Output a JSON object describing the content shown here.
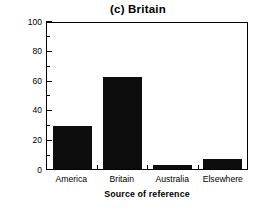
{
  "chart_data": {
    "type": "bar",
    "title": "(c) Britain",
    "xlabel": "Source of reference",
    "ylabel": "Percentage  of  references",
    "categories": [
      "America",
      "Britain",
      "Australia",
      "Elsewhere"
    ],
    "values": [
      29,
      62.5,
      2.5,
      6.5
    ],
    "ylim": [
      0,
      100
    ],
    "yticks": [
      0,
      20,
      40,
      60,
      80,
      100
    ],
    "ytick_labels": [
      "0",
      "20",
      "40",
      "60",
      "80",
      "100"
    ],
    "yminor_ticks": [
      10,
      30,
      50,
      70,
      90
    ],
    "grid": false,
    "legend": null,
    "bar_color": "#0d0d0d",
    "axis_color": "#000000",
    "background": "#ffffff"
  }
}
